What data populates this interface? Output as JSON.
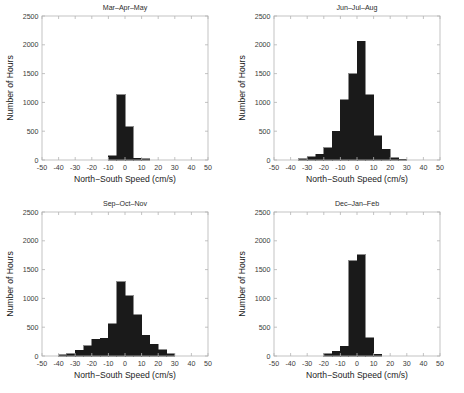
{
  "figure": {
    "width": 464,
    "height": 393,
    "background": "#ffffff",
    "bar_color": "#1a1a1a",
    "axis_color": "#b4b4b4",
    "text_color": "#2b2b2b"
  },
  "chart_data": [
    {
      "type": "bar",
      "title": "Mar–Apr–May",
      "xlabel": "North−South Speed (cm/s)",
      "ylabel": "Number of Hours",
      "xlim": [
        -50,
        50
      ],
      "ylim": [
        0,
        2500
      ],
      "xticks": [
        -50,
        -40,
        -30,
        -20,
        -10,
        0,
        10,
        20,
        30,
        40,
        50
      ],
      "xticklabels": [
        "-50",
        "-40",
        "-30",
        "-20",
        "-10",
        "0",
        "10",
        "20",
        "30",
        "40",
        "50"
      ],
      "yticks": [
        0,
        500,
        1000,
        1500,
        2000,
        2500
      ],
      "yticklabels": [
        "0",
        "500",
        "1000",
        "1500",
        "2000",
        "2500"
      ],
      "grid": false,
      "legend": "none",
      "bin_width": 5,
      "bin_edges": [
        -10,
        -5,
        0,
        5,
        10,
        15
      ],
      "bin_centers": [
        -7.5,
        -2.5,
        2.5,
        7.5,
        12.5
      ],
      "values": [
        70,
        1130,
        580,
        30,
        20
      ]
    },
    {
      "type": "bar",
      "title": "Jun–Jul–Aug",
      "xlabel": "North−South Speed (cm/s)",
      "ylabel": "Number of Hours",
      "xlim": [
        -50,
        50
      ],
      "ylim": [
        0,
        2500
      ],
      "xticks": [
        -50,
        -40,
        -30,
        -20,
        -10,
        0,
        10,
        20,
        30,
        40,
        50
      ],
      "xticklabels": [
        "-50",
        "-40",
        "-30",
        "-20",
        "-10",
        "0",
        "10",
        "20",
        "30",
        "40",
        "50"
      ],
      "yticks": [
        0,
        500,
        1000,
        1500,
        2000,
        2500
      ],
      "yticklabels": [
        "0",
        "500",
        "1000",
        "1500",
        "2000",
        "2500"
      ],
      "grid": false,
      "legend": "none",
      "bin_width": 5,
      "bin_edges": [
        -35,
        -30,
        -25,
        -20,
        -15,
        -10,
        -5,
        0,
        5,
        10,
        15,
        20,
        25,
        30
      ],
      "bin_centers": [
        -32.5,
        -27.5,
        -22.5,
        -17.5,
        -12.5,
        -7.5,
        -2.5,
        2.5,
        7.5,
        12.5,
        17.5,
        22.5,
        27.5
      ],
      "values": [
        20,
        60,
        100,
        210,
        500,
        1050,
        1500,
        2060,
        1130,
        420,
        190,
        40,
        10
      ]
    },
    {
      "type": "bar",
      "title": "Sep–Oct–Nov",
      "xlabel": "North−South Speed (cm/s)",
      "ylabel": "Number of Hours",
      "xlim": [
        -50,
        50
      ],
      "ylim": [
        0,
        2500
      ],
      "xticks": [
        -50,
        -40,
        -30,
        -20,
        -10,
        0,
        10,
        20,
        30,
        40,
        50
      ],
      "xticklabels": [
        "-50",
        "-40",
        "-30",
        "-20",
        "-10",
        "0",
        "10",
        "20",
        "30",
        "40",
        "50"
      ],
      "yticks": [
        0,
        500,
        1000,
        1500,
        2000,
        2500
      ],
      "yticklabels": [
        "0",
        "500",
        "1000",
        "1500",
        "2000",
        "2500"
      ],
      "grid": false,
      "legend": "none",
      "bin_width": 5,
      "bin_edges": [
        -40,
        -35,
        -30,
        -25,
        -20,
        -15,
        -10,
        -5,
        0,
        5,
        10,
        15,
        20,
        25,
        30
      ],
      "bin_centers": [
        -37.5,
        -32.5,
        -27.5,
        -22.5,
        -17.5,
        -12.5,
        -7.5,
        -2.5,
        2.5,
        7.5,
        12.5,
        17.5,
        22.5,
        27.5
      ],
      "values": [
        20,
        40,
        100,
        180,
        290,
        310,
        560,
        1290,
        1050,
        720,
        360,
        200,
        110,
        40
      ]
    },
    {
      "type": "bar",
      "title": "Dec–Jan–Feb",
      "xlabel": "North−South Speed (cm/s)",
      "ylabel": "Number of Hours",
      "xlim": [
        -50,
        50
      ],
      "ylim": [
        0,
        2500
      ],
      "xticks": [
        -50,
        -40,
        -30,
        -20,
        -10,
        0,
        10,
        20,
        30,
        40,
        50
      ],
      "xticklabels": [
        "-50",
        "-40",
        "-30",
        "-20",
        "-10",
        "0",
        "10",
        "20",
        "30",
        "40",
        "50"
      ],
      "yticks": [
        0,
        500,
        1000,
        1500,
        2000,
        2500
      ],
      "yticklabels": [
        "0",
        "500",
        "1000",
        "1500",
        "2000",
        "2500"
      ],
      "grid": false,
      "legend": "none",
      "bin_width": 5,
      "bin_edges": [
        -20,
        -15,
        -10,
        -5,
        0,
        5,
        10,
        15
      ],
      "bin_centers": [
        -17.5,
        -12.5,
        -7.5,
        -2.5,
        2.5,
        7.5,
        12.5
      ],
      "values": [
        40,
        80,
        170,
        1650,
        1760,
        320,
        30
      ]
    }
  ]
}
